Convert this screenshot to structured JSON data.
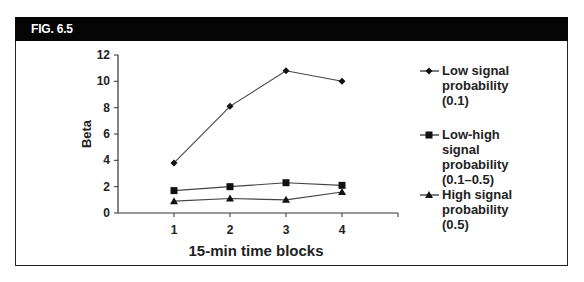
{
  "figure": {
    "label": "FIG. 6.5"
  },
  "chart_data": {
    "type": "line",
    "title": "",
    "xlabel": "15-min time blocks",
    "ylabel": "Beta",
    "categories": [
      "1",
      "2",
      "3",
      "4"
    ],
    "x": [
      1,
      2,
      3,
      4
    ],
    "yticks": [
      "0",
      "2",
      "4",
      "6",
      "8",
      "10",
      "12"
    ],
    "ylim": [
      0,
      12
    ],
    "xlim": [
      0.5,
      5
    ],
    "grid": false,
    "legend_position": "right",
    "series": [
      {
        "name": "Low signal probability (0.1)",
        "marker": "diamond",
        "values": [
          3.8,
          8.1,
          10.8,
          10.0
        ]
      },
      {
        "name": "Low-high signal probability (0.1–0.5)",
        "marker": "square",
        "values": [
          1.7,
          2.0,
          2.3,
          2.1
        ]
      },
      {
        "name": "High signal probability (0.5)",
        "marker": "triangle",
        "values": [
          0.9,
          1.1,
          1.0,
          1.6
        ]
      }
    ]
  },
  "legend": {
    "items": [
      {
        "lines": [
          "Low signal",
          "probability",
          "(0.1)"
        ]
      },
      {
        "lines": [
          "Low-high",
          "signal",
          "probability",
          "(0.1–0.5)"
        ]
      },
      {
        "lines": [
          "High signal",
          "probability",
          "(0.5)"
        ]
      }
    ]
  }
}
